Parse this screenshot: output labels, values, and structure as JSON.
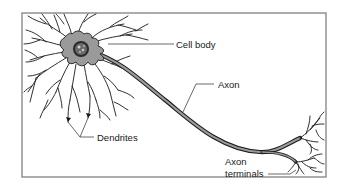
{
  "diagram": {
    "labels": {
      "cell_body": "Cell body",
      "axon": "Axon",
      "dendrites": "Dendrites",
      "axon_terminals_line1": "Axon",
      "axon_terminals_line2": "terminals"
    },
    "colors": {
      "frame": "#8a8a8a",
      "cell_fill": "#9a9a9a",
      "outline": "#1a1a1a",
      "nucleus": "#2a2a2a",
      "leader_line": "#444444"
    }
  }
}
